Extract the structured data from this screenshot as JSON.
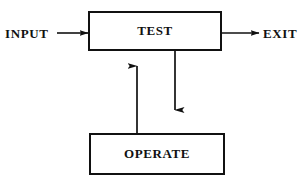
{
  "diagram": {
    "background_color": "#ffffff",
    "line_color": "#111111",
    "nodes": [
      {
        "id": "test",
        "label": "TEST",
        "shape": "rectangle",
        "x": 88,
        "y": 11,
        "width": 134,
        "height": 40
      },
      {
        "id": "operate",
        "label": "OPERATE",
        "shape": "rectangle",
        "x": 89,
        "y": 133,
        "width": 136,
        "height": 42
      }
    ],
    "terminals": [
      {
        "id": "input",
        "label": "INPUT",
        "x": 5,
        "y": 26
      },
      {
        "id": "exit",
        "label": "EXIT",
        "x": 263,
        "y": 26
      }
    ],
    "edges": [
      {
        "id": "input-to-test",
        "from": "input",
        "to": "test",
        "direction": "right",
        "arrowhead": "end",
        "x1": 57,
        "y1": 33,
        "x2": 88,
        "y2": 33
      },
      {
        "id": "test-to-exit",
        "from": "test",
        "to": "exit",
        "direction": "right",
        "arrowhead": "end",
        "x1": 222,
        "y1": 33,
        "x2": 259,
        "y2": 33
      },
      {
        "id": "test-to-operate",
        "from": "test",
        "to": "operate",
        "direction": "down",
        "arrowhead": "end",
        "x1": 175,
        "y1": 51,
        "x2": 175,
        "y2": 110
      },
      {
        "id": "operate-to-test",
        "from": "operate",
        "to": "test",
        "direction": "up",
        "arrowhead": "end",
        "x1": 137,
        "y1": 133,
        "x2": 137,
        "y2": 66
      }
    ]
  }
}
